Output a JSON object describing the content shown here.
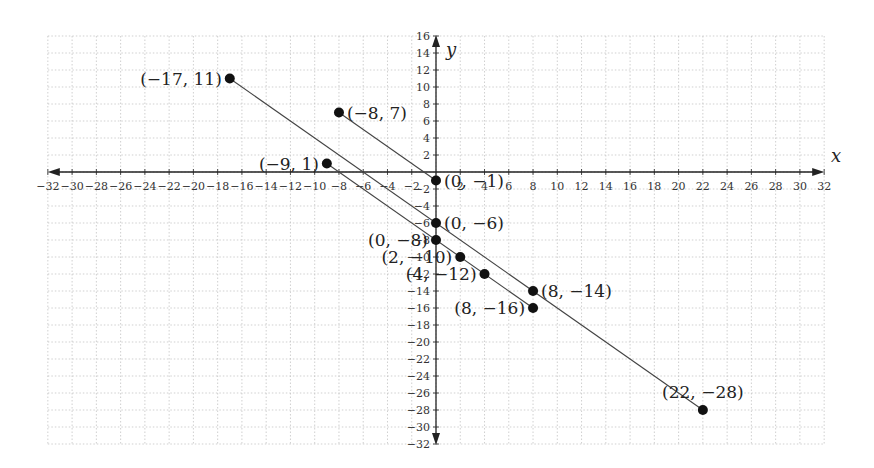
{
  "chart_data": {
    "type": "line",
    "title": "",
    "xlabel": "x",
    "ylabel": "y",
    "xlim": [
      -32,
      32
    ],
    "ylim": [
      -32,
      16
    ],
    "grid": true,
    "grid_step": 2,
    "x_ticks": [
      -32,
      -30,
      -28,
      -26,
      -24,
      -22,
      -20,
      -18,
      -16,
      -14,
      -12,
      -10,
      -8,
      -6,
      -4,
      -2,
      2,
      4,
      6,
      8,
      10,
      12,
      14,
      16,
      18,
      20,
      22,
      24,
      26,
      28,
      30,
      32
    ],
    "y_ticks": [
      16,
      14,
      12,
      10,
      8,
      6,
      4,
      2,
      -2,
      -4,
      -6,
      -8,
      -10,
      -12,
      -14,
      -16,
      -18,
      -20,
      -22,
      -24,
      -26,
      -28,
      -30,
      -32
    ],
    "series": [
      {
        "name": "segment-1",
        "points": [
          [
            -17,
            11
          ],
          [
            0,
            -6
          ],
          [
            8,
            -14
          ],
          [
            22,
            -28
          ]
        ]
      },
      {
        "name": "segment-2",
        "points": [
          [
            -8,
            7
          ],
          [
            0,
            -1
          ]
        ]
      },
      {
        "name": "segment-3",
        "points": [
          [
            -9,
            1
          ],
          [
            0,
            -8
          ],
          [
            2,
            -10
          ],
          [
            4,
            -12
          ],
          [
            8,
            -16
          ]
        ]
      }
    ],
    "labeled_points": [
      {
        "x": -17,
        "y": 11,
        "label": "(−17, 11)",
        "anchor": "left"
      },
      {
        "x": -8,
        "y": 7,
        "label": "(−8, 7)",
        "anchor": "right"
      },
      {
        "x": -9,
        "y": 1,
        "label": "(−9, 1)",
        "anchor": "left"
      },
      {
        "x": 0,
        "y": -1,
        "label": "(0, −1)",
        "anchor": "right"
      },
      {
        "x": 0,
        "y": -6,
        "label": "(0, −6)",
        "anchor": "right"
      },
      {
        "x": 0,
        "y": -8,
        "label": "(0, −8)",
        "anchor": "left"
      },
      {
        "x": 2,
        "y": -10,
        "label": "(2, −10)",
        "anchor": "left"
      },
      {
        "x": 4,
        "y": -12,
        "label": "(4, −12)",
        "anchor": "left"
      },
      {
        "x": 8,
        "y": -14,
        "label": "(8, −14)",
        "anchor": "right"
      },
      {
        "x": 8,
        "y": -16,
        "label": "(8, −16)",
        "anchor": "left"
      },
      {
        "x": 22,
        "y": -28,
        "label": "(22, −28)",
        "anchor": "above"
      }
    ]
  },
  "colors": {
    "axis": "#222222",
    "grid": "#bbbbbb",
    "line": "#444444",
    "point": "#111111"
  }
}
